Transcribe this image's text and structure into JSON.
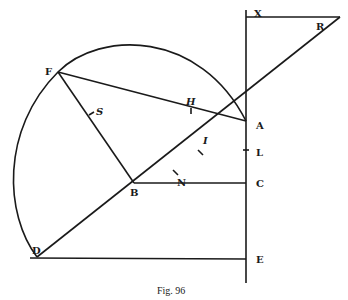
{
  "figure": {
    "caption": "Fig. 96",
    "points": {
      "X": "X",
      "R": "R",
      "A": "A",
      "F": "F",
      "H": "H",
      "S": "S",
      "I": "I",
      "N": "N",
      "L": "L",
      "B": "B",
      "C": "C",
      "D": "D",
      "E": "E"
    },
    "stroke_color": "#1a1a1a",
    "background": "#ffffff"
  }
}
